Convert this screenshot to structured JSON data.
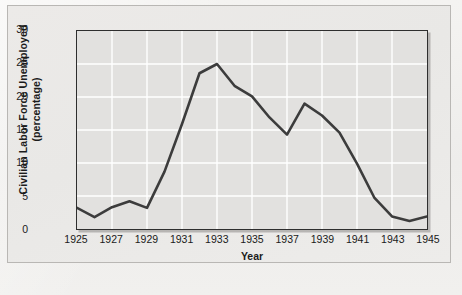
{
  "figure": {
    "caption": ""
  },
  "chart_data": {
    "type": "line",
    "title": "",
    "xlabel": "Year",
    "ylabel": "Civilian Labor Force Unemployed (percentage)",
    "ylabel_line1": "Civilian Labor Force Unemployed",
    "ylabel_line2": "(percentage)",
    "xlim": [
      1925,
      1945
    ],
    "ylim": [
      0,
      30
    ],
    "yticks": [
      0,
      5,
      10,
      15,
      20,
      25,
      30
    ],
    "xticks": [
      1925,
      1927,
      1929,
      1931,
      1933,
      1935,
      1937,
      1939,
      1941,
      1943,
      1945
    ],
    "grid": true,
    "grid_color": "#ffffff",
    "plot_background": "#e2e1df",
    "line_color": "#3c3c3c",
    "legend": null,
    "x": [
      1925,
      1926,
      1927,
      1928,
      1929,
      1930,
      1931,
      1932,
      1933,
      1934,
      1935,
      1936,
      1937,
      1938,
      1939,
      1940,
      1941,
      1942,
      1943,
      1944,
      1945
    ],
    "values": [
      3.2,
      1.8,
      3.3,
      4.2,
      3.2,
      8.7,
      15.9,
      23.6,
      25.0,
      21.7,
      20.1,
      16.9,
      14.3,
      19.0,
      17.2,
      14.6,
      9.9,
      4.7,
      1.9,
      1.2,
      1.9
    ],
    "series": [
      {
        "name": "Civilian Labor Force Unemployed",
        "values": [
          3.2,
          1.8,
          3.3,
          4.2,
          3.2,
          8.7,
          15.9,
          23.6,
          25.0,
          21.7,
          20.1,
          16.9,
          14.3,
          19.0,
          17.2,
          14.6,
          9.9,
          4.7,
          1.9,
          1.2,
          1.9
        ]
      }
    ]
  }
}
